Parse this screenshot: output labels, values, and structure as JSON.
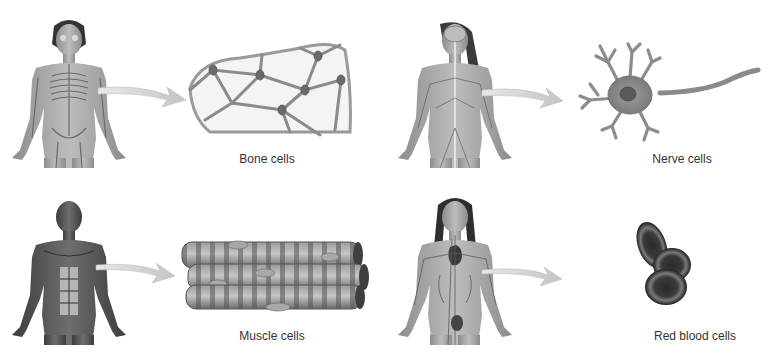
{
  "diagram": {
    "panels": [
      {
        "id": "bone",
        "system": "skeletal-system",
        "cell_label": "Bone cells",
        "figure": "female-skeleton-figure",
        "cell_illustration": "bone-cell-network"
      },
      {
        "id": "nerve",
        "system": "nervous-system",
        "cell_label": "Nerve cells",
        "figure": "female-nervous-system-figure",
        "cell_illustration": "neuron"
      },
      {
        "id": "muscle",
        "system": "muscular-system",
        "cell_label": "Muscle cells",
        "figure": "male-muscle-figure",
        "cell_illustration": "muscle-fibers"
      },
      {
        "id": "blood",
        "system": "circulatory-system",
        "cell_label": "Red blood cells",
        "figure": "female-circulatory-figure",
        "cell_illustration": "red-blood-cells"
      }
    ],
    "colors": {
      "background": "#ffffff",
      "text": "#333333",
      "arrow": "#cfcfcf",
      "tissue_mid": "#8a8a8a",
      "tissue_dark": "#4a4a4a",
      "bone_matrix": "#f4f4f4"
    }
  }
}
